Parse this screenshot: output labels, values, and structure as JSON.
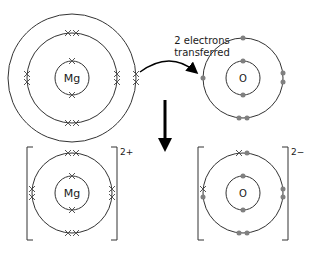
{
  "diagram": {
    "colors": {
      "shell": "#333333",
      "cross": "#555555",
      "dot": "#808080",
      "arrow": "#000000"
    },
    "atoms": {
      "mg_atom": {
        "symbol": "Mg"
      },
      "o_atom": {
        "symbol": "O"
      },
      "mg_ion": {
        "symbol": "Mg",
        "charge": "2+"
      },
      "o_ion": {
        "symbol": "O",
        "charge": "2−"
      }
    },
    "annotation": {
      "line1": "2 electrons",
      "line2": "transferred"
    }
  }
}
